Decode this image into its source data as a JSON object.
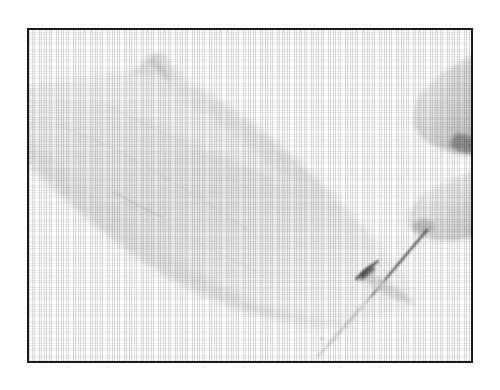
{
  "page": {
    "width": 500,
    "height": 390,
    "background_color": "#ffffff",
    "media_type": "scanned-halftone-photograph"
  },
  "frame": {
    "border_color": "#1a1a1a",
    "border_width_px": 2,
    "fill_color": "#ffffff",
    "left": 27,
    "top": 28,
    "width": 446,
    "height": 335
  },
  "photo": {
    "title": "Needle passing through a skin fold",
    "palette": {
      "paper_white": "#ffffff",
      "highlight": "#fbfbfb",
      "skin_light": "#f0f0f0",
      "skin_mid": "#e2e2e2",
      "skin_shadow": "#cfcfcf",
      "deep_shadow": "#a8a8a8",
      "needle_dark": "#3c3c3c",
      "puncture_dark": "#2e2e2e"
    },
    "subjects": [
      {
        "name": "skin-limb",
        "label": "Pale limb / skin surface",
        "description": "Broad pale mass sweeping diagonally from the upper left edge down to the lower right of the plate."
      },
      {
        "name": "skin-fold-peak",
        "label": "Pinched skin fold",
        "description": "Small raised peak of pinched tissue near the top of the limb."
      },
      {
        "name": "thumb-fingertip",
        "label": "Upper fingertip",
        "description": "Fingertip entering from the right edge, gripping the needle shaft."
      },
      {
        "name": "index-fingertip",
        "label": "Lower fingertip",
        "description": "Second fingertip below, pressing the needle from the opposite side."
      },
      {
        "name": "needle",
        "label": "Needle",
        "description": "Fine straight needle angled from upper right to lower left, piercing the skin fold."
      },
      {
        "name": "puncture-point",
        "label": "Puncture point",
        "description": "Dark shadow where the needle enters and tents the skin."
      }
    ]
  }
}
